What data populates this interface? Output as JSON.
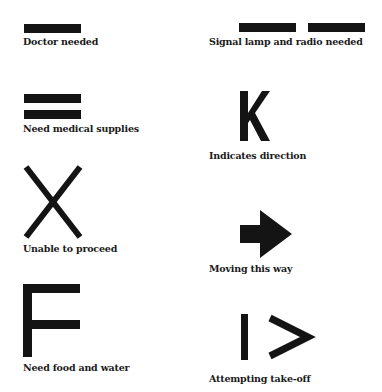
{
  "signals": [
    {
      "symbol": "single-bar",
      "label": "Doctor needed"
    },
    {
      "symbol": "two-horizontal-bars",
      "label": "Signal lamp and radio needed"
    },
    {
      "symbol": "double-bar",
      "label": "Need medical supplies"
    },
    {
      "symbol": "letter-k",
      "label": "Indicates direction"
    },
    {
      "symbol": "letter-x",
      "label": "Unable to proceed"
    },
    {
      "symbol": "arrow-right",
      "label": "Moving this way"
    },
    {
      "symbol": "letter-f",
      "label": "Need food and water"
    },
    {
      "symbol": "bar-and-chevron",
      "label": "Attempting take-off"
    }
  ],
  "colors": {
    "ink": "#141414",
    "background": "#ffffff"
  }
}
